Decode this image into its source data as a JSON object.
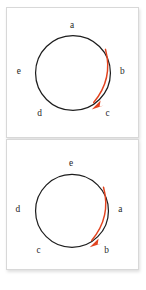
{
  "canvas": {
    "width": 146,
    "height": 290,
    "background": "#ffffff"
  },
  "style": {
    "panel_background": "#ffffff",
    "panel_border": "#d8d8d8",
    "circle_stroke": "#1d1d1d",
    "arrow_color": "#e2431f",
    "label_color": "#262626"
  },
  "diagrams": [
    {
      "id": "circle-diagram-top",
      "description": "Circle with five labelled positions and a clockwise red arrow",
      "circle": {
        "cx": 67,
        "cy": 66,
        "r": 38
      },
      "rotation_direction": "clockwise",
      "labels": [
        {
          "text": "a",
          "position": "top",
          "x": 66,
          "y": 18
        },
        {
          "text": "b",
          "position": "right",
          "x": 117,
          "y": 65
        },
        {
          "text": "c",
          "position": "bottom-right",
          "x": 102,
          "y": 107
        },
        {
          "text": "d",
          "position": "bottom-left",
          "x": 33,
          "y": 107
        },
        {
          "text": "e",
          "position": "left",
          "x": 12,
          "y": 65
        }
      ],
      "arrow": {
        "start": {
          "x": 100,
          "y": 42
        },
        "end": {
          "x": 88,
          "y": 96
        },
        "control": {
          "x": 108,
          "y": 72
        },
        "head_angle_deg": 110
      }
    },
    {
      "id": "circle-diagram-bottom",
      "description": "Same circle rotated one step: labels shifted clockwise",
      "circle": {
        "cx": 66,
        "cy": 72,
        "r": 37
      },
      "rotation_direction": "clockwise",
      "labels": [
        {
          "text": "e",
          "position": "top",
          "x": 65,
          "y": 24
        },
        {
          "text": "a",
          "position": "right",
          "x": 115,
          "y": 71
        },
        {
          "text": "b",
          "position": "bottom-right",
          "x": 101,
          "y": 113
        },
        {
          "text": "c",
          "position": "bottom-left",
          "x": 32,
          "y": 113
        },
        {
          "text": "d",
          "position": "left",
          "x": 11,
          "y": 71
        }
      ],
      "arrow": {
        "start": {
          "x": 98,
          "y": 48
        },
        "end": {
          "x": 86,
          "y": 102
        },
        "control": {
          "x": 106,
          "y": 78
        },
        "head_angle_deg": 110
      }
    }
  ]
}
